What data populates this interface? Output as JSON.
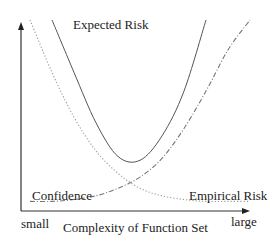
{
  "chart_data": {
    "type": "line",
    "title": "",
    "xlabel": "Complexity of Function Set",
    "ylabel": "",
    "x_tick_labels": {
      "left": "small",
      "right": "large"
    },
    "axis_range_note": "qualitative axes, no numeric ticks",
    "x": [
      0,
      0.1,
      0.2,
      0.3,
      0.4,
      0.5,
      0.6,
      0.7,
      0.8,
      0.9,
      1.0
    ],
    "series": [
      {
        "name": "Expected Risk",
        "style": "solid",
        "color": "#555555",
        "label": "Expected Risk",
        "values": [
          null,
          1.0,
          0.72,
          0.45,
          0.27,
          0.25,
          0.38,
          0.62,
          1.0,
          null,
          null
        ]
      },
      {
        "name": "Confidence",
        "style": "dotted",
        "color": "#999999",
        "label": "Confidence",
        "values": [
          1.0,
          0.72,
          0.48,
          0.3,
          0.18,
          0.1,
          0.06,
          0.04,
          0.03,
          0.03,
          0.03
        ]
      },
      {
        "name": "Empirical Risk",
        "style": "dash-dot",
        "color": "#777777",
        "label": "Empirical Risk",
        "values": [
          0.03,
          0.03,
          0.04,
          0.06,
          0.1,
          0.16,
          0.26,
          0.42,
          0.62,
          0.84,
          1.0
        ]
      }
    ],
    "grid": false,
    "legend": "inline labels"
  }
}
